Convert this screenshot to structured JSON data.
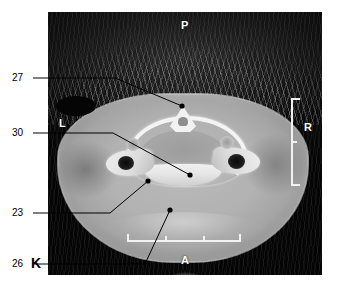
{
  "figure": {
    "letter": "K",
    "modality": "axial-ct-slice"
  },
  "orientation_markers": [
    {
      "id": "posterior",
      "label": "P"
    },
    {
      "id": "left",
      "label": "L"
    },
    {
      "id": "right",
      "label": "R"
    },
    {
      "id": "anterior",
      "label": "A"
    }
  ],
  "callouts": [
    {
      "id": "callout-27",
      "number": "27"
    },
    {
      "id": "callout-30",
      "number": "30"
    },
    {
      "id": "callout-23",
      "number": "23"
    },
    {
      "id": "callout-26",
      "number": "26"
    }
  ],
  "scale_bars": {
    "right_label": "R",
    "bottom_label": "A"
  },
  "colors": {
    "background": "#ffffff",
    "image_field": "#000000",
    "soft_tissue": "#b2b2b2",
    "bone": "#f2f2f2",
    "marker": "#ffffff",
    "callout_text": "#000000",
    "leader_line": "#000000"
  }
}
